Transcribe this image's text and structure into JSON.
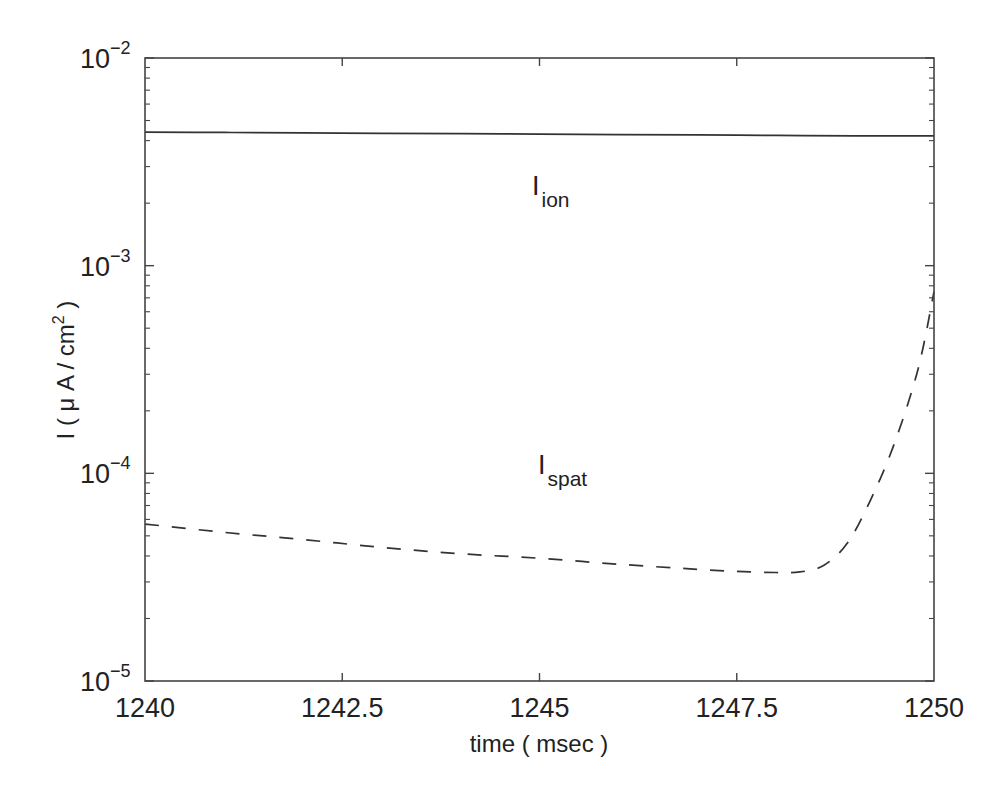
{
  "chart_data": {
    "type": "line",
    "title": "",
    "xlabel": "time ( msec )",
    "ylabel": "I ( μ A / cm² )",
    "ylabel_parts": {
      "prefix": "I ( μ A / cm",
      "sup": "2",
      "suffix": " )"
    },
    "xlim": [
      1240,
      1250
    ],
    "ylim": [
      1e-05,
      0.01
    ],
    "yscale": "log",
    "grid": false,
    "legend": "none (inline annotations)",
    "x_ticks": [
      "1240",
      "1242.5",
      "1245",
      "1247.5",
      "1250"
    ],
    "x_tick_values": [
      1240,
      1242.5,
      1245,
      1247.5,
      1250
    ],
    "y_ticks": [
      {
        "base": "10",
        "exp": "−2",
        "value": 0.01
      },
      {
        "base": "10",
        "exp": "−3",
        "value": 0.001
      },
      {
        "base": "10",
        "exp": "−4",
        "value": 0.0001
      },
      {
        "base": "10",
        "exp": "−5",
        "value": 1e-05
      }
    ],
    "annotations": [
      {
        "main": "I",
        "sub": "ion",
        "x": 1245,
        "y": 0.0019
      },
      {
        "main": "I",
        "sub": "spat",
        "x": 1245,
        "y": 9.5e-05
      }
    ],
    "series": [
      {
        "name": "I_ion",
        "style": "solid",
        "color": "#333333",
        "x": [
          1240,
          1241,
          1242,
          1243,
          1244,
          1245,
          1246,
          1247,
          1248,
          1249,
          1250
        ],
        "values": [
          0.0044,
          0.00438,
          0.00436,
          0.00434,
          0.00432,
          0.0043,
          0.00428,
          0.00426,
          0.00424,
          0.00422,
          0.00422
        ]
      },
      {
        "name": "I_spat",
        "style": "dashed",
        "color": "#333333",
        "x": [
          1240,
          1241,
          1242,
          1243,
          1244,
          1245,
          1246,
          1247,
          1247.5,
          1248,
          1248.3,
          1248.6,
          1248.9,
          1249.2,
          1249.5,
          1249.8,
          1250
        ],
        "values": [
          5.7e-05,
          5.2e-05,
          4.8e-05,
          4.4e-05,
          4.1e-05,
          3.9e-05,
          3.65e-05,
          3.45e-05,
          3.37e-05,
          3.33e-05,
          3.35e-05,
          3.6e-05,
          4.6e-05,
          7.5e-05,
          0.00014,
          0.00032,
          0.00075
        ]
      }
    ]
  }
}
